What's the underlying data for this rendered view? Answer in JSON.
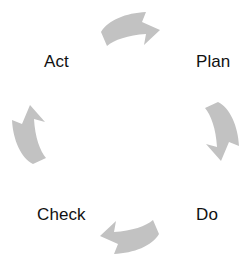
{
  "diagram": {
    "type": "cycle",
    "direction": "clockwise",
    "background_color": "#ffffff",
    "arrow_color": "#c2c2c2",
    "label_color": "#111111",
    "labels": [
      {
        "id": "plan",
        "text": "Plan",
        "position": "top-right"
      },
      {
        "id": "do",
        "text": "Do",
        "position": "bottom-right"
      },
      {
        "id": "check",
        "text": "Check",
        "position": "bottom-left"
      },
      {
        "id": "act",
        "text": "Act",
        "position": "top-left"
      }
    ],
    "arrows": [
      {
        "id": "arrow-top",
        "direction": "right",
        "from": "act",
        "to": "plan"
      },
      {
        "id": "arrow-right",
        "direction": "down",
        "from": "plan",
        "to": "do"
      },
      {
        "id": "arrow-bottom",
        "direction": "left",
        "from": "do",
        "to": "check"
      },
      {
        "id": "arrow-left",
        "direction": "up",
        "from": "check",
        "to": "act"
      }
    ]
  }
}
